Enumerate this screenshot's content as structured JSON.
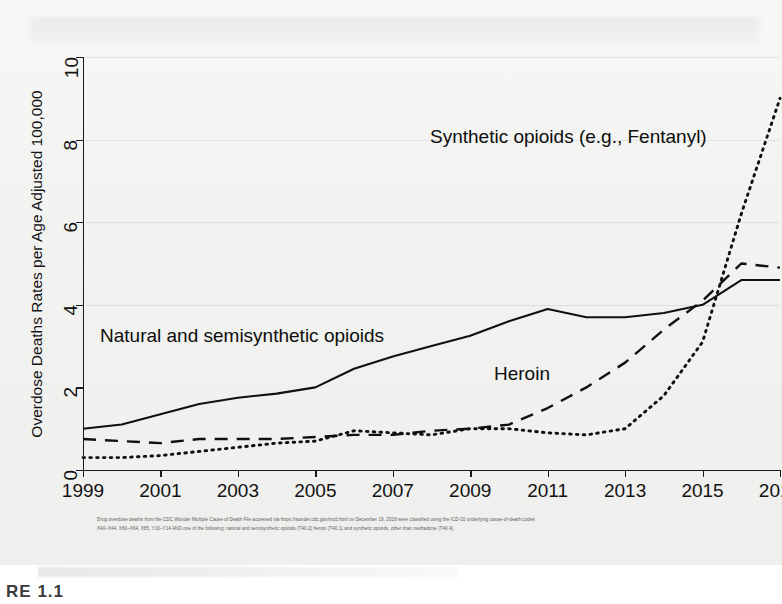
{
  "figure": {
    "caption": "RE 1.1",
    "footnote_lines": [
      "Drug overdose deaths from the CDC Wonder Multiple Cause of Death File accessed via https://wonder.cdc.gov/mcd.html on December 19, 2018 were classified using the ICD-10 underlying cause-of-death codes",
      "X40–X44, X60–X64, X85, Y10–Y14 AND one of the following: natural and semisynthetic opioids (T40.2) heroin (T40.1) and synthetic opioids, other than methadone (T40.4)."
    ]
  },
  "chart_data": {
    "type": "line",
    "title": "",
    "xlabel": "",
    "ylabel": "Overdose Deaths Rates per Age Adjusted 100,000",
    "xlim": [
      1999,
      2017
    ],
    "ylim": [
      0,
      10
    ],
    "yticks": [
      0,
      2,
      4,
      6,
      8,
      10
    ],
    "ytick_labels": [
      "0",
      "2",
      "4",
      "6",
      "8",
      "10"
    ],
    "xticks": [
      1999,
      2001,
      2003,
      2005,
      2007,
      2009,
      2011,
      2013,
      2015,
      2017
    ],
    "xtick_labels": [
      "1999",
      "2001",
      "2003",
      "2005",
      "2007",
      "2009",
      "2011",
      "2013",
      "2015",
      "2017"
    ],
    "grid": false,
    "legend": "inline-annotations",
    "x": [
      1999,
      2000,
      2001,
      2002,
      2003,
      2004,
      2005,
      2006,
      2007,
      2008,
      2009,
      2010,
      2011,
      2012,
      2013,
      2014,
      2015,
      2016,
      2017
    ],
    "series": [
      {
        "name": "Natural and semisynthetic opioids",
        "style": "solid",
        "color": "#101010",
        "values": [
          1.0,
          1.1,
          1.35,
          1.6,
          1.75,
          1.85,
          2.0,
          2.45,
          2.75,
          3.0,
          3.25,
          3.6,
          3.9,
          3.7,
          3.7,
          3.8,
          4.0,
          4.6,
          4.6
        ]
      },
      {
        "name": "Heroin",
        "style": "dashed",
        "color": "#101010",
        "values": [
          0.75,
          0.7,
          0.65,
          0.75,
          0.75,
          0.75,
          0.8,
          0.85,
          0.85,
          0.95,
          1.0,
          1.1,
          1.5,
          2.0,
          2.6,
          3.4,
          4.1,
          5.0,
          4.9
        ]
      },
      {
        "name": "Synthetic opioids (e.g., Fentanyl)",
        "style": "dotted",
        "color": "#101010",
        "values": [
          0.3,
          0.3,
          0.35,
          0.45,
          0.55,
          0.65,
          0.7,
          0.95,
          0.9,
          0.85,
          1.0,
          1.0,
          0.9,
          0.85,
          1.0,
          1.8,
          3.1,
          6.2,
          9.0
        ]
      }
    ],
    "annotations": [
      {
        "id": "synthetic",
        "text": "Synthetic opioids (e.g., Fentanyl)"
      },
      {
        "id": "natural",
        "text": "Natural and semisynthetic opioids"
      },
      {
        "id": "heroin",
        "text": "Heroin"
      }
    ]
  }
}
